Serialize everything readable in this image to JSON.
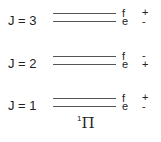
{
  "diagram": {
    "state": {
      "multiplicity": "1",
      "symbol": "Π"
    },
    "levels": [
      {
        "label": "J = 3",
        "upper": {
          "parity_label": "f",
          "sign": "+"
        },
        "lower": {
          "parity_label": "e",
          "sign": "-"
        }
      },
      {
        "label": "J = 2",
        "upper": {
          "parity_label": "f",
          "sign": "-"
        },
        "lower": {
          "parity_label": "e",
          "sign": "+"
        }
      },
      {
        "label": "J = 1",
        "upper": {
          "parity_label": "f",
          "sign": "+"
        },
        "lower": {
          "parity_label": "e",
          "sign": "-"
        }
      }
    ]
  }
}
